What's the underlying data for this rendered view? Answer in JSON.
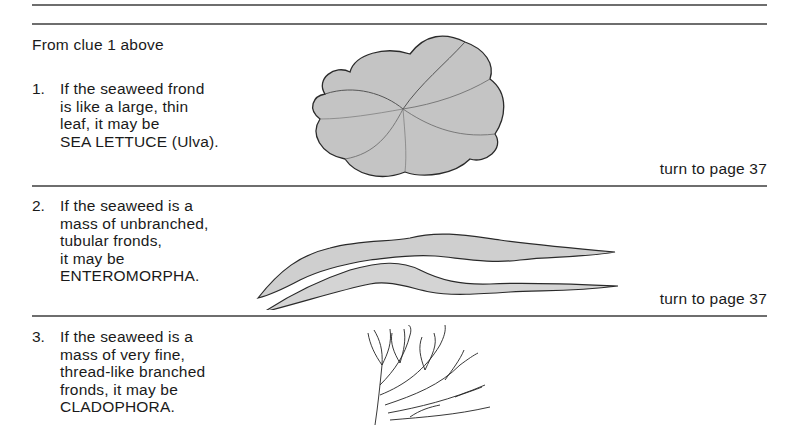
{
  "header": {
    "intro": "From clue 1 above"
  },
  "entries": [
    {
      "number": "1.",
      "lines": [
        "If the seaweed frond",
        "is like a large, thin",
        "leaf, it may be",
        "SEA LETTUCE (Ulva)."
      ],
      "turn": "turn to page 37",
      "illustration": "sea-lettuce-illustration"
    },
    {
      "number": "2.",
      "lines": [
        "If the seaweed is a",
        "mass of unbranched,",
        "tubular fronds,",
        "it may be",
        "ENTEROMORPHA."
      ],
      "turn": "turn to page 37",
      "illustration": "enteromorpha-illustration"
    },
    {
      "number": "3.",
      "lines": [
        "If the seaweed is a",
        "mass of very fine,",
        "thread-like branched",
        "fronds, it may be",
        "CLADOPHORA."
      ],
      "illustration": "cladophora-illustration"
    }
  ],
  "colors": {
    "rule": "#6e6e6e",
    "text": "#1a1a1a",
    "illustration_fill": "#bdbdbd",
    "illustration_stroke": "#2a2a2a"
  }
}
